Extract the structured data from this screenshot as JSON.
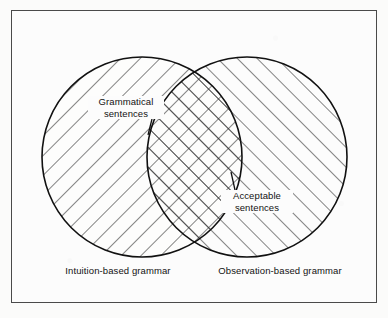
{
  "figure": {
    "type": "venn-diagram",
    "set_count": 2,
    "background_color": "#fbfbfa",
    "frame_color": "#4a4a4a",
    "line_color": "#111111",
    "left_set": {
      "caption": "Intuition-based grammar",
      "hatch_direction": "backslash",
      "center": [
        142,
        157
      ],
      "radius": 100
    },
    "right_set": {
      "caption": "Observation-based grammar",
      "hatch_direction": "forwardslash",
      "center": [
        247,
        157
      ],
      "radius": 100
    },
    "intersection": {
      "hatch_direction": "cross",
      "upper_label_line1": "Grammatical",
      "upper_label_line2": "sentences",
      "lower_label_line1": "Acceptable",
      "lower_label_line2": "sentences"
    }
  },
  "labels": {
    "grammatical_line1": "Grammatical",
    "grammatical_line2": "sentences",
    "acceptable_line1": "Acceptable",
    "acceptable_line2": "sentences",
    "caption_left": "Intuition-based grammar",
    "caption_right": "Observation-based grammar"
  }
}
